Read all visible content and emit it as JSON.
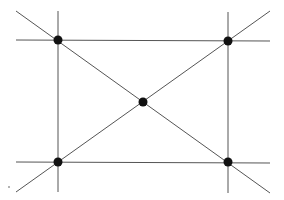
{
  "diagram": {
    "type": "geometric-figure",
    "colors": {
      "line": "#555555",
      "point": "#111111",
      "background": "#ffffff"
    },
    "points": [
      {
        "id": "top-left",
        "x": 58,
        "y": 40
      },
      {
        "id": "top-right",
        "x": 228,
        "y": 41
      },
      {
        "id": "center",
        "x": 143,
        "y": 102
      },
      {
        "id": "bottom-left",
        "x": 58,
        "y": 162
      },
      {
        "id": "bottom-right",
        "x": 228,
        "y": 162
      }
    ],
    "lines": [
      {
        "id": "top-horizontal",
        "x1": 16,
        "y1": 40,
        "x2": 270,
        "y2": 41
      },
      {
        "id": "bottom-horizontal",
        "x1": 16,
        "y1": 162,
        "x2": 270,
        "y2": 163
      },
      {
        "id": "left-vertical",
        "x1": 58,
        "y1": 11,
        "x2": 58,
        "y2": 192
      },
      {
        "id": "right-vertical",
        "x1": 228,
        "y1": 12,
        "x2": 228,
        "y2": 193
      },
      {
        "id": "diagonal-down",
        "x1": 16,
        "y1": 11,
        "x2": 270,
        "y2": 193
      },
      {
        "id": "diagonal-up",
        "x1": 16,
        "y1": 192,
        "x2": 270,
        "y2": 11
      }
    ],
    "speck": {
      "x": 9,
      "y": 187
    }
  }
}
